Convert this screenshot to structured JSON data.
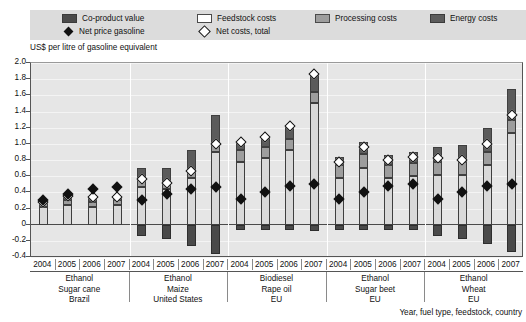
{
  "title": "",
  "legend": {
    "items": [
      {
        "label": "Co-product value",
        "type": "swatch",
        "color": "#4a4a4a",
        "icon": "square-swatch-dark"
      },
      {
        "label": "Feedstock costs",
        "type": "swatch",
        "color": "#ffffff",
        "icon": "square-swatch-white"
      },
      {
        "label": "Processing costs",
        "type": "swatch",
        "color": "#9d9d9d",
        "icon": "square-swatch-mid"
      },
      {
        "label": "Energy costs",
        "type": "swatch",
        "color": "#5b5b5b",
        "icon": "square-swatch-energy"
      },
      {
        "label": "Net price gasoline",
        "type": "marker",
        "color": "#111111",
        "icon": "diamond-solid-icon"
      },
      {
        "label": "Net costs, total",
        "type": "marker",
        "color": "#ffffff",
        "icon": "diamond-open-icon"
      }
    ]
  },
  "axis_caption": "US$ per litre of gasoline equivalent",
  "footnote": "Year, fuel type, feedstock, country",
  "y_ticks": [
    "2.0",
    "1.8",
    "1.6",
    "1.4",
    "1.2",
    "1.0",
    "0.8",
    "0.6",
    "0.4",
    "0.2",
    "0",
    "-0.2",
    "-0.4"
  ],
  "groups": [
    {
      "fuel": "Ethanol",
      "feedstock": "Sugar cane",
      "country": "Brazil",
      "years": [
        "2004",
        "2005",
        "2006",
        "2007"
      ]
    },
    {
      "fuel": "Ethanol",
      "feedstock": "Maize",
      "country": "United States",
      "years": [
        "2004",
        "2005",
        "2006",
        "2007"
      ]
    },
    {
      "fuel": "Biodiesel",
      "feedstock": "Rape oil",
      "country": "EU",
      "years": [
        "2004",
        "2005",
        "2006",
        "2007"
      ]
    },
    {
      "fuel": "Ethanol",
      "feedstock": "Sugar beet",
      "country": "EU",
      "years": [
        "2004",
        "2005",
        "2006",
        "2007"
      ]
    },
    {
      "fuel": "Ethanol",
      "feedstock": "Wheat",
      "country": "EU",
      "years": [
        "2004",
        "2005",
        "2006",
        "2007"
      ]
    }
  ],
  "chart_data": {
    "type": "bar",
    "subtype": "stacked-bar-with-markers",
    "title": "",
    "xlabel": "Year, fuel type, feedstock, country",
    "ylabel": "US$ per litre of gasoline equivalent",
    "ylim": [
      -0.4,
      2.0
    ],
    "ytick_step": 0.2,
    "grid": "horizontal",
    "legend_position": "top",
    "categories": [
      "Ethanol / Sugar cane / Brazil 2004",
      "Ethanol / Sugar cane / Brazil 2005",
      "Ethanol / Sugar cane / Brazil 2006",
      "Ethanol / Sugar cane / Brazil 2007",
      "Ethanol / Maize / United States 2004",
      "Ethanol / Maize / United States 2005",
      "Ethanol / Maize / United States 2006",
      "Ethanol / Maize / United States 2007",
      "Biodiesel / Rape oil / EU 2004",
      "Biodiesel / Rape oil / EU 2005",
      "Biodiesel / Rape oil / EU 2006",
      "Biodiesel / Rape oil / EU 2007",
      "Ethanol / Sugar beet / EU 2004",
      "Ethanol / Sugar beet / EU 2005",
      "Ethanol / Sugar beet / EU 2006",
      "Ethanol / Sugar beet / EU 2007",
      "Ethanol / Wheat / EU 2004",
      "Ethanol / Wheat / EU 2005",
      "Ethanol / Wheat / EU 2006",
      "Ethanol / Wheat / EU 2007"
    ],
    "series": [
      {
        "name": "Feedstock costs",
        "values": [
          0.22,
          0.24,
          0.22,
          0.24,
          0.46,
          0.44,
          0.58,
          0.9,
          0.78,
          0.82,
          0.92,
          1.5,
          0.58,
          0.7,
          0.58,
          0.6,
          0.62,
          0.62,
          0.74,
          1.14
        ]
      },
      {
        "name": "Processing costs",
        "values": [
          0.06,
          0.06,
          0.06,
          0.06,
          0.1,
          0.1,
          0.1,
          0.1,
          0.14,
          0.14,
          0.14,
          0.14,
          0.16,
          0.18,
          0.16,
          0.16,
          0.16,
          0.16,
          0.16,
          0.16
        ]
      },
      {
        "name": "Energy costs",
        "values": [
          0.0,
          0.06,
          0.06,
          0.04,
          0.14,
          0.16,
          0.24,
          0.36,
          0.1,
          0.12,
          0.16,
          0.22,
          0.1,
          0.14,
          0.12,
          0.14,
          0.18,
          0.2,
          0.3,
          0.38
        ]
      },
      {
        "name": "Co-product value",
        "values": [
          0.0,
          0.0,
          0.0,
          0.0,
          -0.14,
          -0.18,
          -0.26,
          -0.36,
          -0.06,
          -0.06,
          -0.06,
          -0.08,
          -0.06,
          -0.06,
          -0.06,
          -0.06,
          -0.14,
          -0.18,
          -0.24,
          -0.34
        ]
      }
    ],
    "markers": [
      {
        "name": "Net costs, total",
        "icon": "diamond-open-icon",
        "values": [
          0.28,
          0.36,
          0.34,
          0.34,
          0.56,
          0.52,
          0.66,
          1.0,
          1.02,
          1.08,
          1.22,
          1.86,
          0.78,
          0.96,
          0.8,
          0.84,
          0.82,
          0.8,
          1.0,
          1.36
        ]
      },
      {
        "name": "Net price gasoline",
        "icon": "diamond-solid-icon",
        "values": [
          0.3,
          0.38,
          0.44,
          0.46,
          0.3,
          0.38,
          0.44,
          0.46,
          0.32,
          0.4,
          0.48,
          0.5,
          0.32,
          0.4,
          0.48,
          0.5,
          0.32,
          0.4,
          0.48,
          0.5
        ]
      }
    ]
  }
}
